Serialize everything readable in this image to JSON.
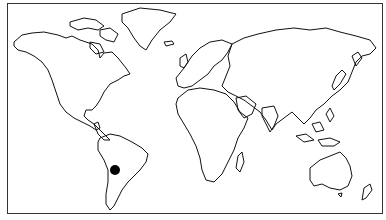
{
  "map": {
    "type": "world-outline",
    "projection": "equirectangular-like",
    "style": "black outline on white",
    "marker": {
      "shape": "filled-circle",
      "color": "#000000",
      "region": "South America (Argentina/Chile)",
      "x": 115,
      "y": 170,
      "radius": 5
    }
  }
}
